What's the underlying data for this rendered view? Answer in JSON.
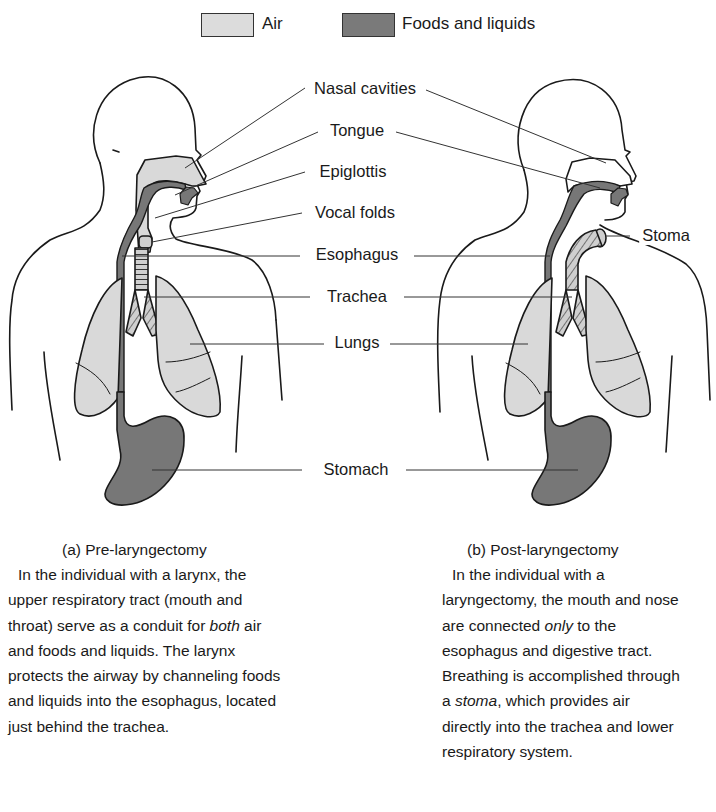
{
  "legend": {
    "items": [
      {
        "label": "Air",
        "color": "#d9d9d9"
      },
      {
        "label": "Foods and liquids",
        "color": "#777777"
      }
    ]
  },
  "labels": {
    "nasal_cavities": "Nasal cavities",
    "tongue": "Tongue",
    "epiglottis": "Epiglottis",
    "vocal_folds": "Vocal folds",
    "esophagus": "Esophagus",
    "trachea": "Trachea",
    "lungs": "Lungs",
    "stomach": "Stomach",
    "stoma": "Stoma"
  },
  "panels": [
    {
      "caption": "(a) Pre-laryngectomy",
      "description": {
        "part1": "In the individual with a larynx, the upper respiratory tract (mouth and throat) serve as a conduit for ",
        "em1": "both",
        "part2": " air and foods and liquids. The larynx protects the airway by channeling foods and liquids into the esophagus, located just behind the trachea."
      }
    },
    {
      "caption": "(b) Post-laryngectomy",
      "description": {
        "part1": "In the individual with a laryngectomy, the mouth and nose are connected ",
        "em1": "only",
        "part2": " to the esophagus and digestive tract. Breathing is accomplished through a ",
        "em2": "stoma",
        "part3": ", which provides air directly into the trachea and lower respiratory system."
      }
    }
  ],
  "colors": {
    "air": "#d9d9d9",
    "food": "#777777",
    "outline": "#1a1a1a"
  }
}
